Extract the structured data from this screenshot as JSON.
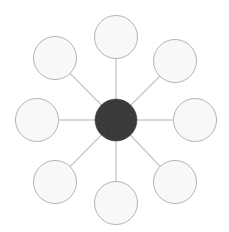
{
  "canvas": {
    "width": 229,
    "height": 232,
    "background": "#ffffff",
    "title": "hub-and-spoke radial node diagram"
  },
  "style": {
    "hub_fill": "#2e2e2e",
    "hub_stroke": "#2e2e2e",
    "node_fill": "#fafafa",
    "node_stroke": "#b3b3b3",
    "node_stroke_width": 1,
    "spoke_color": "#c9c9c9",
    "spoke_width": 1.4
  },
  "hub": {
    "label": "",
    "cx": 116,
    "cy": 120,
    "r": 21,
    "fill": "#2e2e2e"
  },
  "nodes": [
    {
      "name": "node-n",
      "label": "",
      "angle_deg": 270,
      "cx": 116,
      "cy": 37,
      "r": 21.5
    },
    {
      "name": "node-ne",
      "label": "",
      "angle_deg": 315,
      "cx": 175,
      "cy": 61,
      "r": 21.5
    },
    {
      "name": "node-e",
      "label": "",
      "angle_deg": 0,
      "cx": 195,
      "cy": 120,
      "r": 21.5
    },
    {
      "name": "node-se",
      "label": "",
      "angle_deg": 45,
      "cx": 175,
      "cy": 182,
      "r": 21.5
    },
    {
      "name": "node-s",
      "label": "",
      "angle_deg": 90,
      "cx": 116,
      "cy": 203,
      "r": 21.5
    },
    {
      "name": "node-sw",
      "label": "",
      "angle_deg": 135,
      "cx": 55,
      "cy": 182,
      "r": 21.5
    },
    {
      "name": "node-w",
      "label": "",
      "angle_deg": 180,
      "cx": 37,
      "cy": 120,
      "r": 21.5
    },
    {
      "name": "node-nw",
      "label": "",
      "angle_deg": 225,
      "cx": 55,
      "cy": 58,
      "r": 21.5
    }
  ],
  "spokes": [
    {
      "name": "spoke-hub-to-n",
      "x1": 116,
      "y1": 120,
      "x2": 116,
      "y2": 37
    },
    {
      "name": "spoke-hub-to-ne",
      "x1": 116,
      "y1": 120,
      "x2": 175,
      "y2": 61
    },
    {
      "name": "spoke-hub-to-e",
      "x1": 116,
      "y1": 120,
      "x2": 195,
      "y2": 120
    },
    {
      "name": "spoke-hub-to-se",
      "x1": 116,
      "y1": 120,
      "x2": 175,
      "y2": 182
    },
    {
      "name": "spoke-hub-to-s",
      "x1": 116,
      "y1": 120,
      "x2": 116,
      "y2": 203
    },
    {
      "name": "spoke-hub-to-sw",
      "x1": 116,
      "y1": 120,
      "x2": 55,
      "y2": 182
    },
    {
      "name": "spoke-hub-to-w",
      "x1": 116,
      "y1": 120,
      "x2": 37,
      "y2": 120
    },
    {
      "name": "spoke-hub-to-nw",
      "x1": 116,
      "y1": 120,
      "x2": 55,
      "y2": 58
    }
  ]
}
